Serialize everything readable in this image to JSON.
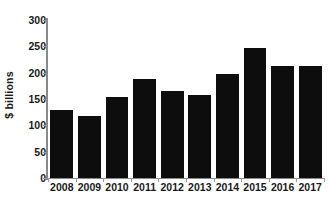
{
  "chart_data": {
    "type": "bar",
    "title": "",
    "subtitle": "",
    "xlabel": "",
    "ylabel": "$ billions",
    "categories": [
      "2008",
      "2009",
      "2010",
      "2011",
      "2012",
      "2013",
      "2014",
      "2015",
      "2016",
      "2017"
    ],
    "values": [
      130,
      117,
      153,
      188,
      166,
      157,
      197,
      247,
      212,
      212
    ],
    "series": [
      {
        "name": "",
        "values": [
          130,
          117,
          153,
          188,
          166,
          157,
          197,
          247,
          212,
          212
        ]
      }
    ],
    "ylim": [
      0,
      300
    ],
    "yticks": [
      0,
      50,
      100,
      150,
      200,
      250,
      300
    ],
    "ytick_labels": [
      "0",
      "50",
      "100",
      "150",
      "200",
      "250",
      "300"
    ],
    "grid": false,
    "legend": false,
    "legend_position": "none",
    "bar_color": "#0d0d0d",
    "axis_color": "#8a8a8a",
    "text_color": "#1a1a1a",
    "background_color": "#ffffff",
    "annotations": []
  }
}
